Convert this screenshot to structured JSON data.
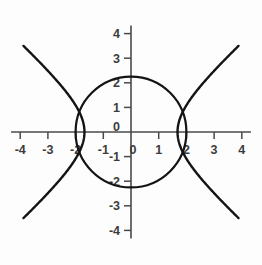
{
  "chart_data": {
    "type": "line",
    "title": "",
    "xlabel": "",
    "ylabel": "",
    "xlim": [
      -4.3,
      4.3
    ],
    "ylim": [
      -4.3,
      4.3
    ],
    "grid": false,
    "legend": "none",
    "background_color": "#fdfdfd",
    "curve_color": "#141414",
    "axis_color": "#4a4a4a",
    "axes": {
      "x_ticks": [
        -4,
        -3,
        -2,
        -1,
        0,
        1,
        2,
        3,
        4
      ],
      "x_tick_labels": [
        "-4",
        "-3",
        "-2",
        "-1",
        "0",
        "1",
        "2",
        "3",
        "4"
      ],
      "y_ticks": [
        -4,
        -3,
        -2,
        -1,
        0,
        1,
        2,
        3,
        4
      ],
      "y_tick_labels": [
        "-4",
        "-3",
        "-2",
        "-1",
        "0",
        "1",
        "2",
        "3",
        "4"
      ],
      "origin_label_x": "0",
      "origin_label_y": "0"
    },
    "series": [
      {
        "name": "circle",
        "equation": "x^2 + y^2 = 4",
        "kind": "circle",
        "center": [
          0,
          0
        ],
        "radius": 2,
        "intercepts": [
          [
            2,
            0
          ],
          [
            -2,
            0
          ],
          [
            0,
            2
          ],
          [
            0,
            -2
          ]
        ]
      },
      {
        "name": "hyperbola",
        "equation": "x^2 - y^2 = 2.8",
        "kind": "hyperbola",
        "orientation": "horizontal",
        "vertices": [
          [
            1.68,
            0
          ],
          [
            -1.68,
            0
          ]
        ],
        "asymptote_slopes": [
          1,
          -1
        ],
        "x_extent": [
          -3.85,
          3.85
        ],
        "y_extent": [
          -3.5,
          3.5
        ]
      }
    ],
    "intersections": [
      [
        -1.95,
        1.2
      ],
      [
        -1.95,
        -1.2
      ],
      [
        1.95,
        1.2
      ],
      [
        1.95,
        -1.2
      ]
    ]
  }
}
